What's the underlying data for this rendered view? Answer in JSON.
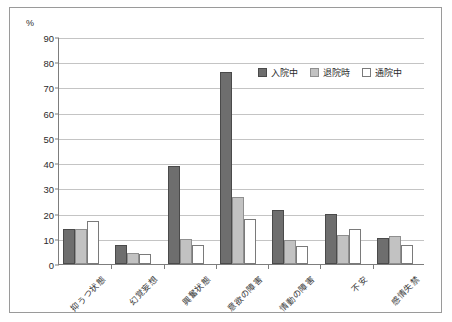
{
  "chart_data": {
    "type": "bar",
    "title": "",
    "subtitle": "",
    "xlabel": "",
    "ylabel": "%",
    "unit_label": "%",
    "ylim": [
      0,
      90
    ],
    "ytick_step": 10,
    "yticks": [
      0,
      10,
      20,
      30,
      40,
      50,
      60,
      70,
      80,
      90
    ],
    "ytick_labels": [
      "0",
      "10",
      "20",
      "30",
      "40",
      "50",
      "60",
      "70",
      "80",
      "90"
    ],
    "grid": true,
    "grid_axis": "y",
    "legend_position": "upper-right-inside",
    "categories": [
      "抑うつ状態",
      "幻覚妄想",
      "興奮状態",
      "意欲の障害",
      "情動の障害",
      "不安",
      "感情失禁"
    ],
    "series": [
      {
        "name": "入院中",
        "color": "#6e6e6e",
        "border": "#4a4a4a",
        "values": [
          14,
          7.5,
          39,
          76,
          21.5,
          20,
          10.5
        ]
      },
      {
        "name": "退院時",
        "color": "#c2c2c2",
        "border": "#8f8f8f",
        "values": [
          14,
          4.5,
          10,
          26.5,
          9.5,
          11.5,
          11
        ]
      },
      {
        "name": "通院中",
        "color": "#ffffff",
        "border": "#7a7a7a",
        "values": [
          17,
          4,
          7.5,
          18,
          7,
          14,
          7.5
        ]
      }
    ]
  }
}
